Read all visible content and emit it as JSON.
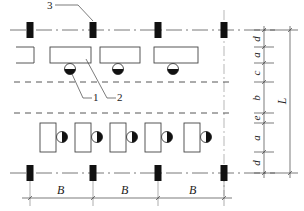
{
  "figure": {
    "callouts": [
      {
        "id": "1",
        "label": "1"
      },
      {
        "id": "2",
        "label": "2"
      },
      {
        "id": "3",
        "label": "3"
      }
    ],
    "horizontal_dimension": {
      "label": "B",
      "spans": 3
    },
    "vertical_dimensions": {
      "segments": [
        "d",
        "a",
        "c",
        "b",
        "e",
        "a",
        "d"
      ],
      "total": "L"
    },
    "colors": {
      "line": "#333333",
      "column_fill": "#111111",
      "background": "#ffffff"
    }
  }
}
